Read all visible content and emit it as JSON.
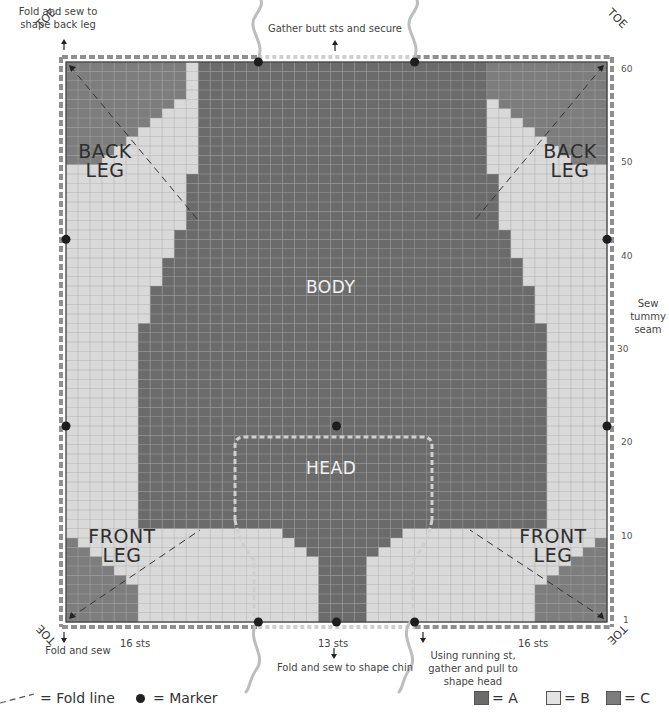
{
  "colors": {
    "A": "#6b6b6b",
    "B": "#d9d9d9",
    "C": "#7d7d7d",
    "grid_on_A": "#8a8a8a",
    "grid_on_B": "#c2c2c2",
    "border": "#3a3a3a",
    "dash": "#8f8f8f",
    "dash_light": "#cfcfcf",
    "marker": "#1e1e1e"
  },
  "chart_data": {
    "type": "heatmap",
    "columns": 45,
    "rows": 60,
    "row_ticks": [
      1,
      10,
      20,
      30,
      40,
      50,
      60
    ],
    "column_groups": [
      {
        "label": "16 sts",
        "count": 16
      },
      {
        "label": "13 sts",
        "count": 13
      },
      {
        "label": "16 sts",
        "count": 16
      }
    ],
    "legend": [
      {
        "key": "A",
        "label": "= A",
        "color": "#6b6b6b"
      },
      {
        "key": "B",
        "label": "= B",
        "color": "#d9d9d9"
      },
      {
        "key": "C",
        "label": "= C",
        "color": "#7d7d7d"
      }
    ],
    "a_spans_by_row_top_down": [
      [
        11,
        34
      ],
      [
        11,
        34
      ],
      [
        11,
        34
      ],
      [
        11,
        34
      ],
      [
        11,
        34
      ],
      [
        11,
        34
      ],
      [
        11,
        34
      ],
      [
        11,
        34
      ],
      [
        11,
        34
      ],
      [
        11,
        34
      ],
      [
        11,
        34
      ],
      [
        11,
        34
      ],
      [
        10,
        35
      ],
      [
        10,
        35
      ],
      [
        10,
        35
      ],
      [
        10,
        35
      ],
      [
        10,
        35
      ],
      [
        10,
        35
      ],
      [
        9,
        36
      ],
      [
        9,
        36
      ],
      [
        9,
        36
      ],
      [
        8,
        37
      ],
      [
        8,
        37
      ],
      [
        8,
        37
      ],
      [
        7,
        38
      ],
      [
        7,
        38
      ],
      [
        7,
        38
      ],
      [
        7,
        38
      ],
      [
        6,
        39
      ],
      [
        6,
        39
      ],
      [
        6,
        39
      ],
      [
        6,
        39
      ],
      [
        6,
        39
      ],
      [
        6,
        39
      ],
      [
        6,
        39
      ],
      [
        6,
        39
      ],
      [
        6,
        39
      ],
      [
        6,
        39
      ],
      [
        6,
        39
      ],
      [
        6,
        39
      ],
      [
        6,
        39
      ],
      [
        6,
        39
      ],
      [
        6,
        39
      ],
      [
        6,
        39
      ],
      [
        6,
        39
      ],
      [
        6,
        39
      ],
      [
        6,
        39
      ],
      [
        6,
        39
      ],
      [
        6,
        39
      ],
      [
        6,
        39
      ],
      [
        18,
        27
      ],
      [
        19,
        26
      ],
      [
        20,
        25
      ],
      [
        21,
        24
      ],
      [
        21,
        24
      ],
      [
        21,
        24
      ],
      [
        21,
        24
      ],
      [
        21,
        24
      ],
      [
        21,
        24
      ],
      [
        21,
        24
      ]
    ],
    "c_corner_top_left_widths": [
      10,
      10,
      10,
      10,
      9,
      8,
      7,
      6,
      5,
      4,
      3
    ],
    "c_corner_bottom_left_widths": [
      6,
      6,
      6,
      6,
      5,
      4,
      3,
      2,
      1
    ],
    "c_corner_top_right_widths": [
      10,
      10,
      10,
      10,
      9,
      8,
      7,
      6,
      5,
      4,
      3
    ],
    "c_corner_bottom_right_widths": [
      6,
      6,
      6,
      6,
      5,
      4,
      3,
      2,
      1
    ],
    "markers": [
      {
        "col": 16,
        "row": 60
      },
      {
        "col": 29,
        "row": 60
      },
      {
        "col": 0,
        "row": 41
      },
      {
        "col": 45,
        "row": 41
      },
      {
        "col": 0,
        "row": 21
      },
      {
        "col": 45,
        "row": 21
      },
      {
        "col": 22.5,
        "row": 21
      },
      {
        "col": 16,
        "row": 0
      },
      {
        "col": 22.5,
        "row": 0
      },
      {
        "col": 29,
        "row": 0
      }
    ]
  },
  "labels": {
    "back_leg_left": [
      "BACK",
      "LEG"
    ],
    "back_leg_right": [
      "BACK",
      "LEG"
    ],
    "front_leg_left": [
      "FRONT",
      "LEG"
    ],
    "front_leg_right": [
      "FRONT",
      "LEG"
    ],
    "body": "BODY",
    "head": "HEAD",
    "toe": "TOE"
  },
  "notes": {
    "top_left": "Fold and sew to\nshape back leg",
    "top_center": "Gather butt sts and secure",
    "right_side": "Sew\ntummy\nseam",
    "bottom_left": "Fold and sew",
    "bottom_center": "Fold and sew to shape chin",
    "bottom_right": "Using running st,\ngather and pull to\nshape head",
    "sts_left": "16 sts",
    "sts_center": "13 sts",
    "sts_right": "16 sts"
  },
  "legend": {
    "fold_line": "= Fold line",
    "marker": "= Marker",
    "a": "= A",
    "b": "= B",
    "c": "= C"
  },
  "axis": {
    "t60": "60",
    "t50": "50",
    "t40": "40",
    "t30": "30",
    "t20": "20",
    "t10": "10",
    "t1": "1"
  }
}
